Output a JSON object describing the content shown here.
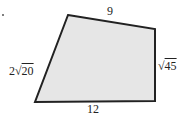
{
  "diagram": {
    "type": "quadrilateral",
    "fill": "#e6e6e6",
    "stroke": "#222222",
    "vertices": [
      [
        68,
        15
      ],
      [
        155,
        29
      ],
      [
        155,
        101
      ],
      [
        35,
        102
      ]
    ],
    "labels": {
      "top": "9",
      "right_coef": "",
      "right_radicand": "45",
      "bottom": "12",
      "left_coef": "2",
      "left_radicand": "20"
    }
  }
}
